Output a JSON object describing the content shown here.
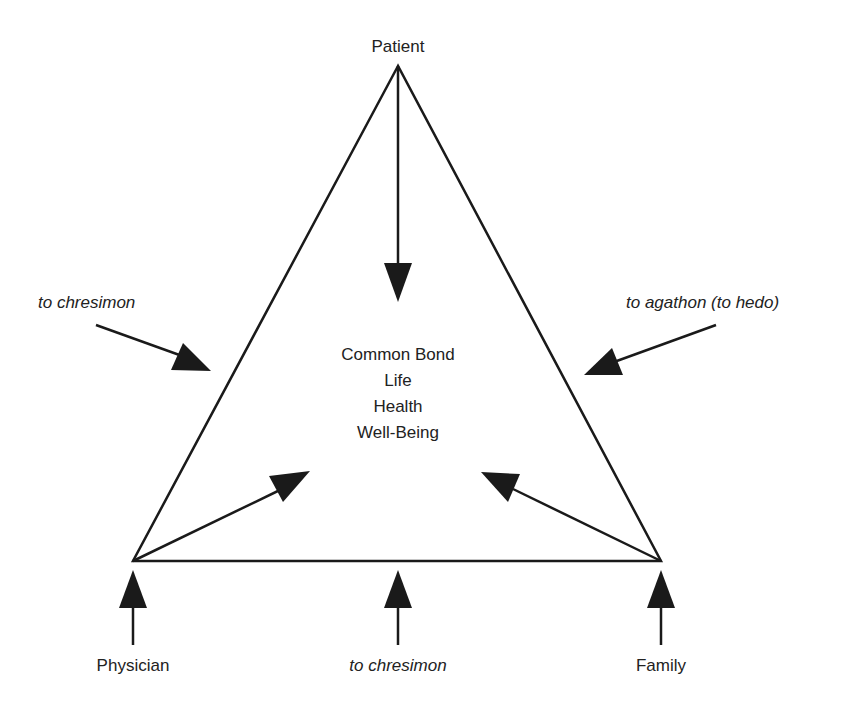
{
  "diagram": {
    "vertices": {
      "top": "Patient",
      "bottom_left": "Physician",
      "bottom_right": "Family"
    },
    "center_text": [
      "Common Bond",
      "Life",
      "Health",
      "Well-Being"
    ],
    "side_labels": {
      "left": "to chresimon",
      "right": "to agathon (to hedo)",
      "bottom": "to chresimon"
    },
    "colors": {
      "line": "#1a1a1a",
      "text": "#222222",
      "background": "#ffffff"
    }
  }
}
